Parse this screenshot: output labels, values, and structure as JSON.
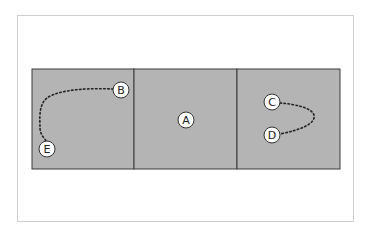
{
  "diagram": {
    "panels": [
      {
        "id": "left"
      },
      {
        "id": "middle"
      },
      {
        "id": "right"
      }
    ],
    "nodes": [
      {
        "label": "B",
        "x": 121,
        "y": 90
      },
      {
        "label": "E",
        "x": 47,
        "y": 149
      },
      {
        "label": "A",
        "x": 186,
        "y": 120
      },
      {
        "label": "C",
        "x": 272,
        "y": 102
      },
      {
        "label": "D",
        "x": 272,
        "y": 135
      }
    ],
    "paths": [
      {
        "from": "B",
        "to": "E",
        "style": "dotted"
      },
      {
        "from": "C",
        "to": "D",
        "style": "dotted"
      }
    ],
    "colors": {
      "panel_fill": "#b4b4b4",
      "panel_border": "#3a3a3a",
      "node_fill": "#ffffff",
      "node_border": "#333333",
      "path": "#222222",
      "frame_border": "#cfcfcf"
    }
  }
}
